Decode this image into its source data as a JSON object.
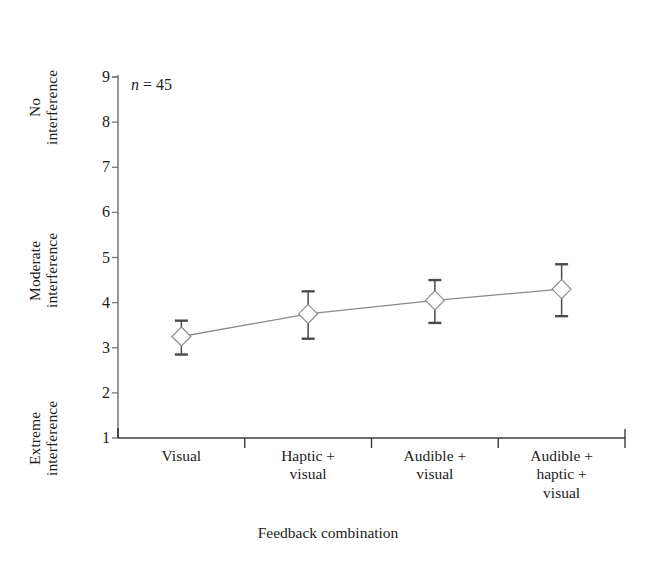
{
  "chart_data": {
    "type": "line",
    "title": "",
    "subtitle": "",
    "xlabel": "Feedback combination",
    "ylabel": "",
    "categories": [
      "Visual",
      "Haptic +\nvisual",
      "Audible +\nvisual",
      "Audible +\nhaptic +\nvisual"
    ],
    "series": [
      {
        "name": "Mean interference rating",
        "values": [
          3.25,
          3.75,
          4.05,
          4.3
        ],
        "error_low": [
          2.85,
          3.2,
          3.55,
          3.7
        ],
        "error_high": [
          3.6,
          4.25,
          4.5,
          4.85
        ],
        "marker": "diamond",
        "marker_fill": "#ffffff",
        "line_color": "#8a8a8a",
        "error_color": "#4a4a4a"
      }
    ],
    "ylim": [
      1,
      9
    ],
    "yticks": [
      1,
      2,
      3,
      4,
      5,
      6,
      7,
      8,
      9
    ],
    "ytick_labels": [
      "1",
      "2",
      "3",
      "4",
      "5",
      "6",
      "7",
      "8",
      "9"
    ],
    "grid": false,
    "legend": null,
    "annotations": [
      {
        "name": "sample-size",
        "text": "n = 45",
        "symbol": "n",
        "rest": " = 45"
      }
    ],
    "y_zone_labels": [
      {
        "name": "no-interference",
        "text": "No\ninterference",
        "at_value": 9
      },
      {
        "name": "moderate-interference",
        "text": "Moderate\ninterference",
        "at_value": 5
      },
      {
        "name": "extreme-interference",
        "text": "Extreme\ninterference",
        "at_value": 1
      }
    ]
  },
  "axes": {
    "x_axis_line_color": "#3d3d3d",
    "y_axis_line_color": "#7d7d7d",
    "tick_direction": "out"
  }
}
